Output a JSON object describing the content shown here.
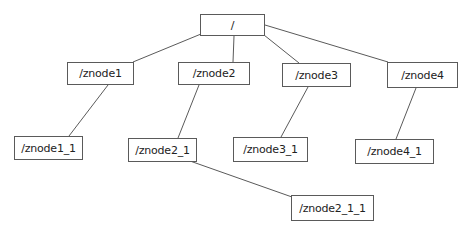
{
  "diagram": {
    "type": "tree",
    "line_color": "#5a5a5a",
    "nodes": {
      "root": {
        "label": "/",
        "x": 200,
        "y": 14,
        "w": 65,
        "h": 22
      },
      "znode1": {
        "label": "/znode1",
        "x": 67,
        "y": 62,
        "w": 67,
        "h": 23
      },
      "znode2": {
        "label": "/znode2",
        "x": 178,
        "y": 62,
        "w": 72,
        "h": 23
      },
      "znode3": {
        "label": "/znode3",
        "x": 282,
        "y": 63,
        "w": 69,
        "h": 24
      },
      "znode4": {
        "label": "/znode4",
        "x": 387,
        "y": 62,
        "w": 71,
        "h": 26
      },
      "znode1_1": {
        "label": "/znode1_1",
        "x": 14,
        "y": 136,
        "w": 69,
        "h": 24
      },
      "znode2_1": {
        "label": "/znode2_1",
        "x": 128,
        "y": 138,
        "w": 69,
        "h": 24
      },
      "znode3_1": {
        "label": "/znode3_1",
        "x": 233,
        "y": 137,
        "w": 75,
        "h": 25
      },
      "znode4_1": {
        "label": "/znode4_1",
        "x": 355,
        "y": 139,
        "w": 79,
        "h": 25
      },
      "znode2_1_1": {
        "label": "/znode2_1_1",
        "x": 291,
        "y": 195,
        "w": 83,
        "h": 26
      }
    },
    "edges": [
      {
        "from": "root",
        "to": "znode1",
        "x1": 201,
        "y1": 34,
        "x2": 133,
        "y2": 62
      },
      {
        "from": "root",
        "to": "znode2",
        "x1": 234,
        "y1": 36,
        "x2": 233,
        "y2": 62
      },
      {
        "from": "root",
        "to": "znode3",
        "x1": 264,
        "y1": 35,
        "x2": 299,
        "y2": 63
      },
      {
        "from": "root",
        "to": "znode4",
        "x1": 265,
        "y1": 25,
        "x2": 388,
        "y2": 62
      },
      {
        "from": "znode1",
        "to": "znode1_1",
        "x1": 108,
        "y1": 85,
        "x2": 69,
        "y2": 136
      },
      {
        "from": "znode2",
        "to": "znode2_1",
        "x1": 199,
        "y1": 85,
        "x2": 178,
        "y2": 138
      },
      {
        "from": "znode3",
        "to": "znode3_1",
        "x1": 308,
        "y1": 87,
        "x2": 281,
        "y2": 137
      },
      {
        "from": "znode4",
        "to": "znode4_1",
        "x1": 416,
        "y1": 88,
        "x2": 396,
        "y2": 139
      },
      {
        "from": "znode2_1",
        "to": "znode2_1_1",
        "x1": 190,
        "y1": 161,
        "x2": 292,
        "y2": 197
      }
    ]
  }
}
